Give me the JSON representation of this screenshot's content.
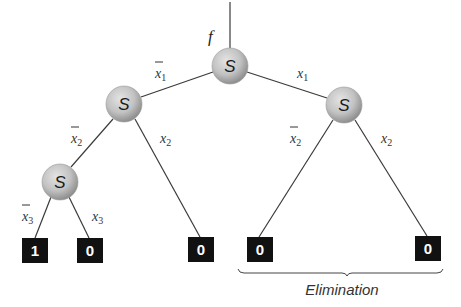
{
  "diagram": {
    "type": "decision-tree",
    "function_label": "f",
    "node_symbol": "S",
    "nodes": [
      {
        "id": "root",
        "label": "S",
        "cx": 230,
        "cy": 66
      },
      {
        "id": "left",
        "label": "S",
        "cx": 124,
        "cy": 104
      },
      {
        "id": "right",
        "label": "S",
        "cx": 344,
        "cy": 105
      },
      {
        "id": "left-left",
        "label": "S",
        "cx": 60,
        "cy": 182
      }
    ],
    "terminals": [
      {
        "id": "t1",
        "value": "1",
        "x": 22,
        "y": 238
      },
      {
        "id": "t2",
        "value": "0",
        "x": 77,
        "y": 238
      },
      {
        "id": "t3",
        "value": "0",
        "x": 188,
        "y": 237
      },
      {
        "id": "t4",
        "value": "0",
        "x": 247,
        "y": 237
      },
      {
        "id": "t5",
        "value": "0",
        "x": 415,
        "y": 236
      }
    ],
    "edge_labels": [
      {
        "var": "x",
        "sub": "1",
        "negated": true,
        "x": 153,
        "y": 78
      },
      {
        "var": "x",
        "sub": "1",
        "negated": false,
        "x": 297,
        "y": 78
      },
      {
        "var": "x",
        "sub": "2",
        "negated": true,
        "x": 69,
        "y": 143
      },
      {
        "var": "x",
        "sub": "2",
        "negated": false,
        "x": 160,
        "y": 143
      },
      {
        "var": "x",
        "sub": "2",
        "negated": true,
        "x": 288,
        "y": 143
      },
      {
        "var": "x",
        "sub": "2",
        "negated": false,
        "x": 381,
        "y": 143
      },
      {
        "var": "x",
        "sub": "3",
        "negated": true,
        "x": 20,
        "y": 222
      },
      {
        "var": "x",
        "sub": "3",
        "negated": false,
        "x": 92,
        "y": 222
      }
    ],
    "brace_caption": "Elimination"
  }
}
